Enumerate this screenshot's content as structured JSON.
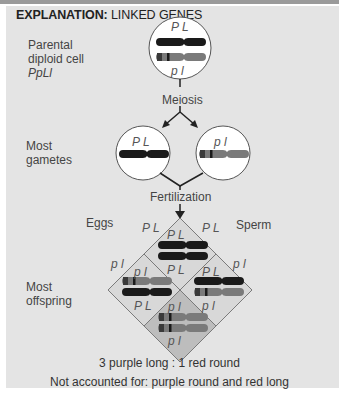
{
  "header": {
    "title_bold": "EXPLANATION:",
    "title_rest": " LINKED GENES"
  },
  "labels": {
    "parental_line1": "Parental",
    "parental_line2": "diploid cell",
    "parental_genotype": "PpLl",
    "meiosis": "Meiosis",
    "gametes_line1": "Most",
    "gametes_line2": "gametes",
    "fertilization": "Fertilization",
    "eggs": "Eggs",
    "sperm": "Sperm",
    "offspring_line1": "Most",
    "offspring_line2": "offspring"
  },
  "alleles": {
    "dominant": "P L",
    "recessive": "p l"
  },
  "punnett": {
    "egg_alleles": [
      "P L",
      "p l"
    ],
    "sperm_alleles": [
      "P L",
      "p l"
    ],
    "cells": [
      {
        "top": "P L",
        "bottom": "P L",
        "phenotype": "purple long"
      },
      {
        "top": "p l",
        "bottom": "P L",
        "phenotype": "purple long"
      },
      {
        "top": "P L",
        "bottom": "p l",
        "phenotype": "purple long"
      },
      {
        "top": "p l",
        "bottom": "p l",
        "phenotype": "red round"
      }
    ]
  },
  "results": {
    "ratio": "3 purple long : 1 red round",
    "note": "Not accounted for: purple round and red long"
  },
  "colors": {
    "panel_bg": "#e4e4e4",
    "dominant_chromosome": "#1a1a1a",
    "recessive_chromosome": "#777777",
    "cell_bg": "#d6d6d6",
    "bottom_cell_bg": "#bdbdbd",
    "line": "#7a7a7a"
  }
}
